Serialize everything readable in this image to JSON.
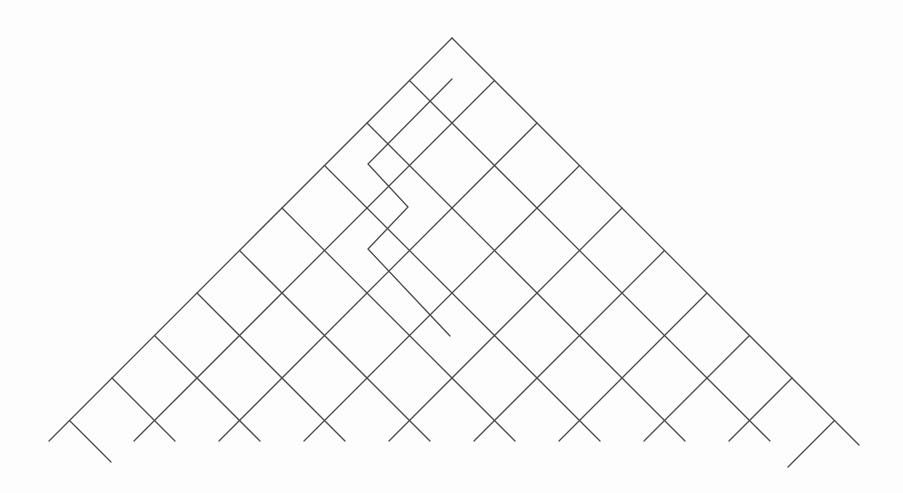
{
  "diagram": {
    "type": "triangular-diagonal-grid-with-pipe-path",
    "stroke_color": "#4a4a4a",
    "background": "#fdfdfd",
    "apex": [
      452,
      38
    ],
    "cell_diagonal": 85,
    "line_count_per_direction": 10,
    "bottom_y": 441,
    "extended_tails": {
      "backslash_last_end_y": 462,
      "slash_last_end_y": 467,
      "right_edge_end_y": 445
    },
    "special_path": [
      [
        452,
        79
      ],
      [
        368,
        164
      ],
      [
        408,
        207
      ],
      [
        368,
        249
      ],
      [
        450,
        336
      ]
    ]
  }
}
